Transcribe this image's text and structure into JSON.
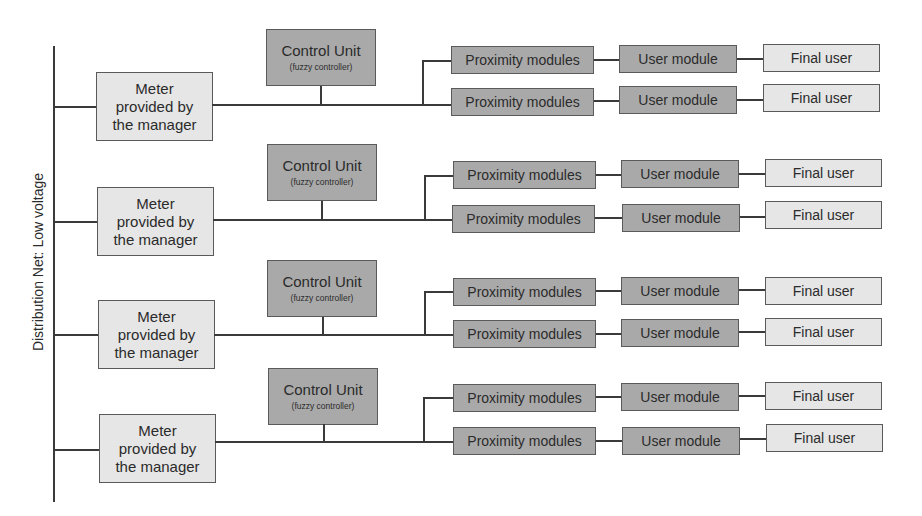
{
  "diagram": {
    "bus_label": "Distribution Net: Low voltage",
    "colors": {
      "light_box": "#e6e6e6",
      "dark_box": "#a9a9a9",
      "line": "#3a3a3a",
      "border": "#5a5a5a"
    },
    "rows": [
      {
        "meter": [
          "Meter",
          "provided by",
          "the manager"
        ],
        "control_unit": {
          "title": "Control Unit",
          "subtitle": "(fuzzy controller)"
        },
        "branches": [
          {
            "proximity": "Proximity modules",
            "user_module": "User module",
            "final_user": "Final user"
          },
          {
            "proximity": "Proximity modules",
            "user_module": "User module",
            "final_user": "Final user"
          }
        ]
      },
      {
        "meter": [
          "Meter",
          "provided by",
          "the manager"
        ],
        "control_unit": {
          "title": "Control Unit",
          "subtitle": "(fuzzy controller)"
        },
        "branches": [
          {
            "proximity": "Proximity modules",
            "user_module": "User module",
            "final_user": "Final user"
          },
          {
            "proximity": "Proximity modules",
            "user_module": "User module",
            "final_user": "Final user"
          }
        ]
      },
      {
        "meter": [
          "Meter",
          "provided by",
          "the manager"
        ],
        "control_unit": {
          "title": "Control Unit",
          "subtitle": "(fuzzy controller)"
        },
        "branches": [
          {
            "proximity": "Proximity modules",
            "user_module": "User module",
            "final_user": "Final user"
          },
          {
            "proximity": "Proximity modules",
            "user_module": "User module",
            "final_user": "Final user"
          }
        ]
      },
      {
        "meter": [
          "Meter",
          "provided by",
          "the manager"
        ],
        "control_unit": {
          "title": "Control Unit",
          "subtitle": "(fuzzy controller)"
        },
        "branches": [
          {
            "proximity": "Proximity modules",
            "user_module": "User module",
            "final_user": "Final user"
          },
          {
            "proximity": "Proximity modules",
            "user_module": "User module",
            "final_user": "Final user"
          }
        ]
      }
    ]
  }
}
